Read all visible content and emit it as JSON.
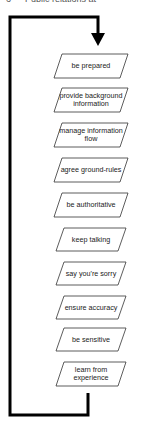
{
  "header": {
    "cutoff_text": "6 — Public relations at"
  },
  "diagram": {
    "type": "flowchart-loop",
    "steps": [
      {
        "label": "be prepared"
      },
      {
        "label": "provide background information"
      },
      {
        "label": "manage information flow"
      },
      {
        "label": "agree ground-rules"
      },
      {
        "label": "be authoritative"
      },
      {
        "label": "keep talking"
      },
      {
        "label": "say you're sorry"
      },
      {
        "label": "ensure accuracy"
      },
      {
        "label": "be sensitive"
      },
      {
        "label": "learn from experience"
      }
    ],
    "colors": {
      "line": "#000000",
      "box_stroke": "#333333",
      "text": "#222222"
    }
  }
}
